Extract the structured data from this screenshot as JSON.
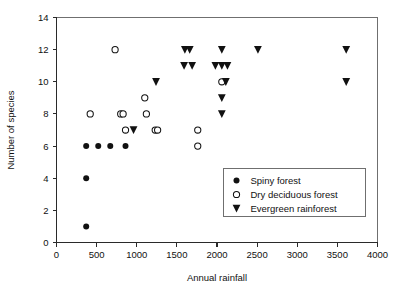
{
  "chart_data": {
    "type": "scatter",
    "title": "",
    "xlabel": "Annual rainfall",
    "ylabel": "Number of species",
    "xlim": [
      0,
      4000
    ],
    "ylim": [
      0,
      14
    ],
    "xticks": [
      0,
      500,
      1000,
      1500,
      2000,
      2500,
      3000,
      3500,
      4000
    ],
    "xtick_labels": [
      "0",
      "500",
      "1000",
      "1500",
      "2000",
      "2500",
      "3000",
      "3500",
      "4000"
    ],
    "yticks": [
      0,
      2,
      4,
      6,
      8,
      10,
      12,
      14
    ],
    "ytick_labels": [
      "0",
      "2",
      "4",
      "6",
      "8",
      "10",
      "12",
      "14"
    ],
    "grid": false,
    "legend_position": "lower right",
    "series": [
      {
        "name": "Spiny forest",
        "marker": "filled-circle",
        "color": "#111111",
        "points": [
          [
            370,
            1
          ],
          [
            370,
            4
          ],
          [
            370,
            6
          ],
          [
            520,
            6
          ],
          [
            670,
            6
          ],
          [
            860,
            6
          ]
        ]
      },
      {
        "name": "Dry deciduous forest",
        "marker": "open-circle",
        "color": "#111111",
        "points": [
          [
            420,
            8
          ],
          [
            730,
            12
          ],
          [
            800,
            8
          ],
          [
            830,
            8
          ],
          [
            860,
            7
          ],
          [
            1100,
            9
          ],
          [
            1120,
            8
          ],
          [
            1230,
            7
          ],
          [
            1260,
            7
          ],
          [
            1760,
            7
          ],
          [
            1760,
            6
          ],
          [
            2060,
            10
          ]
        ]
      },
      {
        "name": "Evergreen rainforest",
        "marker": "triangle-down",
        "color": "#111111",
        "points": [
          [
            960,
            7
          ],
          [
            1240,
            10
          ],
          [
            1600,
            12
          ],
          [
            1660,
            12
          ],
          [
            1590,
            11
          ],
          [
            1690,
            11
          ],
          [
            2060,
            12
          ],
          [
            1980,
            11
          ],
          [
            2060,
            11
          ],
          [
            2130,
            11
          ],
          [
            2110,
            10
          ],
          [
            2060,
            9
          ],
          [
            2060,
            8
          ],
          [
            2510,
            12
          ],
          [
            3610,
            12
          ],
          [
            3610,
            10
          ]
        ]
      }
    ]
  },
  "legend": {
    "entries": [
      {
        "label": "Spiny forest",
        "marker": "filled-circle"
      },
      {
        "label": "Dry deciduous forest",
        "marker": "open-circle"
      },
      {
        "label": "Evergreen rainforest",
        "marker": "triangle-down"
      }
    ]
  }
}
